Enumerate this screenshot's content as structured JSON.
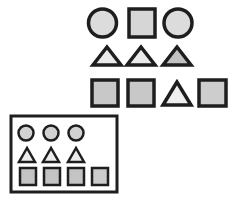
{
  "colors": {
    "stroke": "#1e1e1e",
    "fill_light": "#e4e4e4",
    "fill_mid": "#cfcfcf",
    "fill_dark": "#bdbdbd",
    "background": "#ffffff"
  },
  "top_grid": {
    "rows": [
      [
        "circle",
        "square",
        "circle"
      ],
      [
        "triangle",
        "triangle",
        "triangle"
      ],
      [
        "square",
        "square",
        "triangle",
        "square"
      ]
    ]
  },
  "bottom_panel": {
    "rows": [
      [
        "circle",
        "circle",
        "circle"
      ],
      [
        "triangle",
        "triangle",
        "triangle"
      ],
      [
        "square",
        "square",
        "square",
        "square"
      ]
    ]
  }
}
